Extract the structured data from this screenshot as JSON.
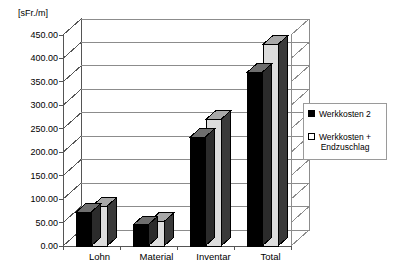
{
  "chart_data": {
    "type": "bar",
    "title": "",
    "subtitle": "",
    "xlabel": "",
    "ylabel": "[sFr./m]",
    "categories": [
      "Lohn",
      "Material",
      "Inventar",
      "Total"
    ],
    "series": [
      {
        "name": "Werkkosten 2",
        "color": "#000000",
        "values": [
          72,
          45,
          232,
          370
        ]
      },
      {
        "name": "Werkkosten + Endzuschlag",
        "color": "#d9d9d9",
        "values": [
          85,
          52,
          270,
          430
        ]
      }
    ],
    "ylim": [
      0,
      450
    ],
    "ytick_step": 50,
    "ytick_labels": [
      "450.00",
      "400.00",
      "350.00",
      "300.00",
      "250.00",
      "200.00",
      "150.00",
      "100.00",
      "50.00",
      "0.00"
    ],
    "ytick_values": [
      450,
      400,
      350,
      300,
      250,
      200,
      150,
      100,
      50,
      0
    ],
    "grid": true,
    "grid_axis": "y",
    "legend_position": "right",
    "style": "3d-column",
    "legend_entries": [
      {
        "label": "Werkkosten 2",
        "swatch": "black"
      },
      {
        "label": "Werkkosten +\nEndzuschlag",
        "swatch": "white"
      }
    ]
  },
  "colors": {
    "bar_dark": "#000000",
    "bar_light": "#dcdcdc",
    "bar_side_dark": "#2b2b2b",
    "bar_top_light": "#a8a8a8",
    "axis": "#555555",
    "grid": "#8c8c8c",
    "legend_border": "#9a9a9a",
    "background": "#ffffff"
  }
}
